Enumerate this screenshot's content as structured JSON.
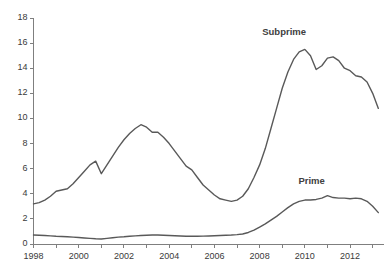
{
  "chart_data": {
    "type": "line",
    "title": "",
    "xlabel": "",
    "ylabel": "",
    "xlim": [
      1998,
      2013.5
    ],
    "ylim": [
      0,
      18
    ],
    "ytick_step": 2,
    "grid": false,
    "legend_position": "inline-annotation",
    "axis_color": "#7f7f7f",
    "line_color": "#595959",
    "background": "#ffffff",
    "ytick_labels": [
      "0",
      "2",
      "4",
      "6",
      "8",
      "10",
      "12",
      "14",
      "16",
      "18"
    ],
    "ytick_values": [
      0,
      2,
      4,
      6,
      8,
      10,
      12,
      14,
      16,
      18
    ],
    "xtick_labels": [
      "1998",
      "2000",
      "2002",
      "2004",
      "2006",
      "2008",
      "2010",
      "2012"
    ],
    "xtick_values": [
      1998,
      2000,
      2002,
      2004,
      2006,
      2008,
      2010,
      2012
    ],
    "xtick_minor_values": [
      1999,
      2001,
      2003,
      2005,
      2007,
      2009,
      2011,
      2013
    ],
    "x": [
      1998.0,
      1998.25,
      1998.5,
      1998.75,
      1999.0,
      1999.25,
      1999.5,
      1999.75,
      2000.0,
      2000.25,
      2000.5,
      2000.75,
      2001.0,
      2001.25,
      2001.5,
      2001.75,
      2002.0,
      2002.25,
      2002.5,
      2002.75,
      2003.0,
      2003.25,
      2003.5,
      2003.75,
      2004.0,
      2004.25,
      2004.5,
      2004.75,
      2005.0,
      2005.25,
      2005.5,
      2005.75,
      2006.0,
      2006.25,
      2006.5,
      2006.75,
      2007.0,
      2007.25,
      2007.5,
      2007.75,
      2008.0,
      2008.25,
      2008.5,
      2008.75,
      2009.0,
      2009.25,
      2009.5,
      2009.75,
      2010.0,
      2010.25,
      2010.5,
      2010.75,
      2011.0,
      2011.25,
      2011.5,
      2011.75,
      2012.0,
      2012.25,
      2012.5,
      2012.75,
      2013.0,
      2013.25
    ],
    "series": [
      {
        "name": "Subprime",
        "label_x": 2009.0,
        "label_y": 16.9,
        "values": [
          3.2,
          3.3,
          3.5,
          3.8,
          4.2,
          4.3,
          4.4,
          4.8,
          5.3,
          5.8,
          6.3,
          6.6,
          5.6,
          6.3,
          7.0,
          7.7,
          8.3,
          8.8,
          9.2,
          9.5,
          9.3,
          8.9,
          8.9,
          8.5,
          8.0,
          7.4,
          6.8,
          6.2,
          5.9,
          5.3,
          4.7,
          4.3,
          3.9,
          3.6,
          3.5,
          3.4,
          3.5,
          3.8,
          4.4,
          5.3,
          6.3,
          7.6,
          9.2,
          10.8,
          12.4,
          13.7,
          14.7,
          15.3,
          15.5,
          15.0,
          13.9,
          14.2,
          14.8,
          14.9,
          14.6,
          14.0,
          13.8,
          13.4,
          13.3,
          12.9,
          12.0,
          10.8
        ]
      },
      {
        "name": "Prime",
        "label_x": 2010.6,
        "label_y": 5.0,
        "values": [
          0.72,
          0.7,
          0.68,
          0.65,
          0.62,
          0.6,
          0.58,
          0.55,
          0.52,
          0.48,
          0.45,
          0.42,
          0.4,
          0.45,
          0.5,
          0.55,
          0.58,
          0.62,
          0.65,
          0.68,
          0.7,
          0.72,
          0.72,
          0.7,
          0.68,
          0.66,
          0.64,
          0.62,
          0.62,
          0.62,
          0.63,
          0.64,
          0.66,
          0.68,
          0.7,
          0.72,
          0.75,
          0.8,
          0.92,
          1.1,
          1.35,
          1.6,
          1.9,
          2.2,
          2.55,
          2.9,
          3.2,
          3.4,
          3.5,
          3.5,
          3.55,
          3.65,
          3.85,
          3.7,
          3.65,
          3.65,
          3.6,
          3.65,
          3.6,
          3.4,
          3.0,
          2.5
        ]
      }
    ]
  }
}
